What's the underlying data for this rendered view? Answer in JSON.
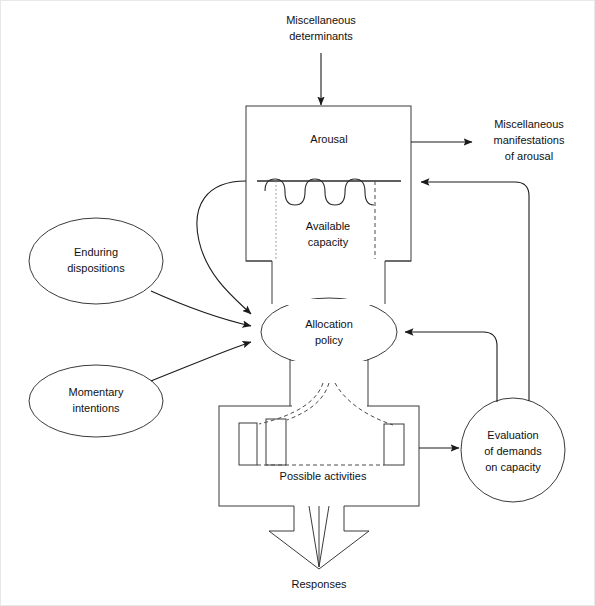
{
  "figure": {
    "domain": "diagram"
  },
  "colors": {
    "stroke": "#3a3a3a",
    "connector": "#1a1a1a",
    "text": "#111111",
    "background": "#ffffff",
    "border": "#e8e8e8"
  },
  "nodes": {
    "misc_determinants": {
      "label_line1": "Miscellaneous",
      "label_line2": "determinants",
      "shape": "text"
    },
    "arousal": {
      "label": "Arousal",
      "shape": "rectangle"
    },
    "available_capacity": {
      "label_line1": "Available",
      "label_line2": "capacity",
      "shape": "rectangle-region"
    },
    "misc_manifestations": {
      "label_line1": "Miscellaneous",
      "label_line2": "manifestations",
      "label_line3": "of arousal",
      "shape": "text"
    },
    "enduring_dispositions": {
      "label_line1": "Enduring",
      "label_line2": "dispositions",
      "shape": "ellipse"
    },
    "momentary_intentions": {
      "label_line1": "Momentary",
      "label_line2": "intentions",
      "shape": "ellipse"
    },
    "allocation_policy": {
      "label_line1": "Allocation",
      "label_line2": "policy",
      "shape": "ellipse"
    },
    "possible_activities": {
      "label": "Possible activities",
      "shape": "rectangle"
    },
    "evaluation_demands": {
      "label_line1": "Evaluation",
      "label_line2": "of demands",
      "label_line3": "on capacity",
      "shape": "circle"
    },
    "responses": {
      "label": "Responses",
      "shape": "hollow-arrow"
    }
  },
  "edges": [
    {
      "name": "determinants-to-arousal",
      "from": "misc_determinants",
      "to": "arousal",
      "style": "solid-arrow"
    },
    {
      "name": "arousal-to-manifestations",
      "from": "arousal",
      "to": "misc_manifestations",
      "style": "solid-arrow"
    },
    {
      "name": "capacity-to-allocation",
      "from": "available_capacity",
      "to": "allocation_policy",
      "style": "curved-arrow"
    },
    {
      "name": "enduring-to-allocation",
      "from": "enduring_dispositions",
      "to": "allocation_policy",
      "style": "curved-arrow"
    },
    {
      "name": "momentary-to-allocation",
      "from": "momentary_intentions",
      "to": "allocation_policy",
      "style": "curved-arrow"
    },
    {
      "name": "allocation-to-activities",
      "from": "allocation_policy",
      "to": "possible_activities",
      "style": "dashed-fan"
    },
    {
      "name": "activities-to-evaluation",
      "from": "possible_activities",
      "to": "evaluation_demands",
      "style": "solid-arrow"
    },
    {
      "name": "evaluation-to-allocation",
      "from": "evaluation_demands",
      "to": "allocation_policy",
      "style": "feedback-arrow"
    },
    {
      "name": "evaluation-to-arousal",
      "from": "evaluation_demands",
      "to": "arousal",
      "style": "feedback-arrow"
    },
    {
      "name": "activities-to-responses",
      "from": "possible_activities",
      "to": "responses",
      "style": "hollow-arrow"
    }
  ]
}
